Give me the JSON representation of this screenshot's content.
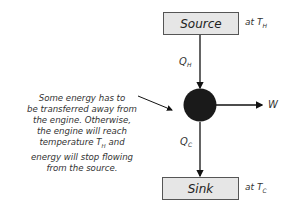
{
  "diagram": {
    "source": {
      "label": "Source",
      "temp_prefix": "at T",
      "temp_sub": "H"
    },
    "sink": {
      "label": "Sink",
      "temp_prefix": "at T",
      "temp_sub": "C"
    },
    "q_hot": {
      "symbol": "Q",
      "sub": "H"
    },
    "q_cold": {
      "symbol": "Q",
      "sub": "C"
    },
    "work": {
      "symbol": "W"
    },
    "engine": {
      "shape": "filled-circle",
      "color": "#1a1a1a"
    },
    "annotation": {
      "lines": [
        "Some energy has to",
        "be transferred away from",
        "the engine.  Otherwise,",
        "the engine will reach",
        "temperature T",
        "energy will stop flowing",
        "from the source."
      ],
      "temp_sub": "H",
      "temp_suffix": " and"
    },
    "colors": {
      "box_fill": "#e6e6e6",
      "box_border": "#555555",
      "line": "#111111"
    }
  }
}
